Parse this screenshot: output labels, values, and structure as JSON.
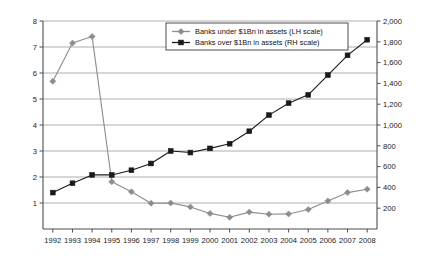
{
  "chart_data": {
    "type": "line",
    "title": "",
    "subtitle": "",
    "xlabel": "",
    "ylabel": "",
    "grid": true,
    "legend_position": "top-center",
    "categories": [
      1992,
      1993,
      1994,
      1995,
      1996,
      1997,
      1998,
      1999,
      2000,
      2001,
      2002,
      2003,
      2004,
      2005,
      2006,
      2007,
      2008
    ],
    "x_tick_labels": [
      "1992",
      "1993",
      "1994",
      "1995",
      "1996",
      "1997",
      "1998",
      "1999",
      "2000",
      "2001",
      "2002",
      "2003",
      "2004",
      "2005",
      "2006",
      "2007",
      "2008"
    ],
    "left_axis": {
      "label": "",
      "ylim": [
        0,
        8
      ],
      "ticks": [
        1,
        2,
        3,
        4,
        5,
        6,
        7,
        8
      ],
      "tick_labels": [
        "1",
        "2",
        "3",
        "4",
        "5",
        "6",
        "7",
        "8"
      ]
    },
    "right_axis": {
      "label": "",
      "ylim": [
        0,
        2000
      ],
      "ticks": [
        200,
        400,
        600,
        800,
        1000,
        1200,
        1400,
        1600,
        1800,
        2000
      ],
      "tick_labels": [
        "200",
        "400",
        "600",
        "800",
        "1,000",
        "1,200",
        "1,400",
        "1,600",
        "1,800",
        "2,000"
      ]
    },
    "series": [
      {
        "name": "Banks under $1Bn in assets (LH scale)",
        "axis": "left",
        "color": "#8c8c8c",
        "marker": "diamond",
        "values": [
          5.68,
          7.15,
          7.4,
          1.82,
          1.43,
          0.99,
          1.0,
          0.85,
          0.6,
          0.45,
          0.65,
          0.57,
          0.58,
          0.75,
          1.08,
          1.4,
          1.53
        ]
      },
      {
        "name": "Banks over $1Bn in assets (RH scale)",
        "axis": "right",
        "color": "#1a1a1a",
        "marker": "square",
        "values": [
          350,
          440,
          520,
          520,
          565,
          630,
          750,
          735,
          775,
          820,
          940,
          1095,
          1210,
          1290,
          1480,
          1670,
          1820
        ]
      }
    ]
  },
  "legend": {
    "entries": [
      {
        "label": "Banks under $1Bn in assets (LH scale)",
        "marker": "diamond",
        "color": "#8c8c8c"
      },
      {
        "label": "Banks over $1Bn in assets (RH scale)",
        "marker": "square",
        "color": "#1a1a1a"
      }
    ]
  },
  "colors": {
    "series_gray": "#8c8c8c",
    "series_black": "#1a1a1a",
    "gridline": "#9a9a9a",
    "axis": "#4d4d4d",
    "background": "#ffffff"
  }
}
